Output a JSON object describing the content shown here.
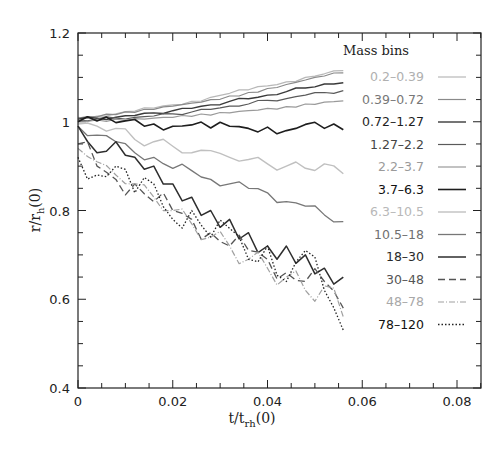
{
  "chart_data": {
    "type": "line",
    "title": "",
    "xlabel": "t/t_rh(0)",
    "ylabel": "r/r_h(0)",
    "xlim": [
      0,
      0.085
    ],
    "ylim": [
      0.4,
      1.2
    ],
    "xticks": [
      0,
      0.02,
      0.04,
      0.06,
      0.08
    ],
    "xtick_labels": [
      "0",
      "0.02",
      "0.04",
      "0.06",
      "0.08"
    ],
    "yticks": [
      0.4,
      0.6,
      0.8,
      1.0,
      1.2
    ],
    "ytick_labels": [
      "0.4",
      "0.6",
      "0.8",
      "1",
      "1.2"
    ],
    "grid": false,
    "legend": {
      "title": "Mass bins",
      "position": "upper right inside"
    },
    "x": [
      0,
      0.004,
      0.008,
      0.012,
      0.016,
      0.02,
      0.024,
      0.028,
      0.032,
      0.036,
      0.04,
      0.044,
      0.048,
      0.052,
      0.056
    ],
    "series": [
      {
        "name": "0.2-0.39",
        "color": "#b8b8b8",
        "dash": "",
        "width": 1.2,
        "values": [
          1.01,
          1.013,
          1.018,
          1.024,
          1.031,
          1.038,
          1.046,
          1.055,
          1.064,
          1.072,
          1.081,
          1.09,
          1.1,
          1.108,
          1.115
        ]
      },
      {
        "name": "0.39-0.72",
        "color": "#8a8a8a",
        "dash": "",
        "width": 1.2,
        "values": [
          1.008,
          1.011,
          1.016,
          1.021,
          1.028,
          1.035,
          1.042,
          1.05,
          1.058,
          1.066,
          1.075,
          1.084,
          1.094,
          1.103,
          1.11
        ]
      },
      {
        "name": "0.72-1.27",
        "color": "#3a3a3a",
        "dash": "",
        "width": 1.4,
        "values": [
          1.006,
          1.008,
          1.01,
          1.014,
          1.02,
          1.025,
          1.03,
          1.038,
          1.046,
          1.052,
          1.06,
          1.068,
          1.076,
          1.085,
          1.088
        ]
      },
      {
        "name": "1.27-2.2",
        "color": "#5a5a5a",
        "dash": "",
        "width": 1.2,
        "values": [
          1.004,
          1.006,
          1.008,
          1.01,
          1.013,
          1.018,
          1.022,
          1.028,
          1.035,
          1.04,
          1.048,
          1.052,
          1.06,
          1.066,
          1.07
        ]
      },
      {
        "name": "2.2-3.7",
        "color": "#9a9a9a",
        "dash": "",
        "width": 1.2,
        "values": [
          1.002,
          1.004,
          1.006,
          1.007,
          1.008,
          1.01,
          1.012,
          1.015,
          1.02,
          1.025,
          1.03,
          1.034,
          1.04,
          1.044,
          1.047
        ]
      },
      {
        "name": "3.7-6.3",
        "color": "#1e1e1e",
        "dash": "",
        "width": 1.6,
        "values": [
          1.0,
          1.002,
          0.998,
          1.005,
          0.995,
          0.99,
          0.993,
          0.986,
          0.99,
          0.985,
          0.988,
          0.98,
          0.994,
          0.985,
          0.982
        ]
      },
      {
        "name": "6.3-10.5",
        "color": "#c0c0c0",
        "dash": "",
        "width": 1.4,
        "values": [
          0.995,
          0.99,
          0.985,
          0.96,
          0.955,
          0.945,
          0.93,
          0.935,
          0.92,
          0.915,
          0.905,
          0.9,
          0.895,
          0.905,
          0.883
        ]
      },
      {
        "name": "10.5-18",
        "color": "#777777",
        "dash": "",
        "width": 1.3,
        "values": [
          0.99,
          0.97,
          0.955,
          0.93,
          0.92,
          0.895,
          0.89,
          0.87,
          0.86,
          0.85,
          0.84,
          0.82,
          0.81,
          0.79,
          0.775
        ]
      },
      {
        "name": "18-30",
        "color": "#2e2e2e",
        "dash": "",
        "width": 1.5,
        "values": [
          0.99,
          0.93,
          0.955,
          0.92,
          0.9,
          0.86,
          0.83,
          0.8,
          0.78,
          0.75,
          0.72,
          0.72,
          0.7,
          0.67,
          0.65
        ]
      },
      {
        "name": "30-48",
        "color": "#555555",
        "dash": "7,4",
        "width": 1.3,
        "values": [
          0.95,
          0.9,
          0.87,
          0.86,
          0.82,
          0.8,
          0.78,
          0.75,
          0.72,
          0.71,
          0.69,
          0.66,
          0.64,
          0.64,
          0.58
        ]
      },
      {
        "name": "48-78",
        "color": "#a0a0a0",
        "dash": "6,2,1,2",
        "width": 1.2,
        "values": [
          0.94,
          0.91,
          0.88,
          0.86,
          0.83,
          0.8,
          0.77,
          0.74,
          0.72,
          0.69,
          0.67,
          0.65,
          0.62,
          0.63,
          0.56
        ]
      },
      {
        "name": "78-120",
        "color": "#222222",
        "dash": "1.5,2",
        "width": 1.3,
        "values": [
          0.92,
          0.88,
          0.9,
          0.84,
          0.86,
          0.78,
          0.8,
          0.74,
          0.76,
          0.69,
          0.72,
          0.64,
          0.71,
          0.62,
          0.53
        ]
      }
    ]
  },
  "legend": {
    "title": "Mass bins",
    "items": [
      {
        "label": "0.2–0.39",
        "text_color": "#b0b0b0"
      },
      {
        "label": "0.39–0.72",
        "text_color": "#777777"
      },
      {
        "label": "0.72–1.27",
        "text_color": "#1e1e1e"
      },
      {
        "label": "1.27–2.2",
        "text_color": "#444444"
      },
      {
        "label": "2.2–3.7",
        "text_color": "#9a9a9a"
      },
      {
        "label": "3.7–6.3",
        "text_color": "#111111"
      },
      {
        "label": "6.3–10.5",
        "text_color": "#b8b8b8"
      },
      {
        "label": "10.5–18",
        "text_color": "#707070"
      },
      {
        "label": "18–30",
        "text_color": "#2a2a2a"
      },
      {
        "label": "30–48",
        "text_color": "#555555"
      },
      {
        "label": "48–78",
        "text_color": "#a8a8a8"
      },
      {
        "label": "78–120",
        "text_color": "#111111"
      }
    ]
  },
  "axes": {
    "x_title_main": "t/t",
    "x_title_sub": "rh",
    "x_title_tail": "(0)",
    "y_title_main": "r/r",
    "y_title_sub": "h",
    "y_title_tail": "(0)"
  }
}
